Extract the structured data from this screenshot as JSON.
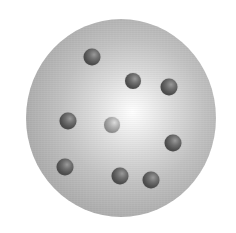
{
  "diagram": {
    "description": "Plum pudding atomic model: gray positively charged sphere with embedded electrons",
    "sphere": {
      "center_x": 121,
      "center_y": 118,
      "radius_x": 95,
      "radius_y": 99,
      "highlight_color": "#ffffff",
      "edge_color": "#9c9c9c"
    },
    "electrons": [
      {
        "x": 92,
        "y": 57,
        "d": 17,
        "shade": "dark"
      },
      {
        "x": 133,
        "y": 81,
        "d": 16,
        "shade": "dark"
      },
      {
        "x": 169,
        "y": 87,
        "d": 17,
        "shade": "dark"
      },
      {
        "x": 68,
        "y": 121,
        "d": 17,
        "shade": "dark"
      },
      {
        "x": 112,
        "y": 125,
        "d": 16,
        "shade": "light"
      },
      {
        "x": 173,
        "y": 143,
        "d": 17,
        "shade": "dark"
      },
      {
        "x": 65,
        "y": 167,
        "d": 17,
        "shade": "dark"
      },
      {
        "x": 120,
        "y": 176,
        "d": 17,
        "shade": "dark"
      },
      {
        "x": 151,
        "y": 180,
        "d": 17,
        "shade": "dark"
      }
    ],
    "electron_count": 9
  }
}
